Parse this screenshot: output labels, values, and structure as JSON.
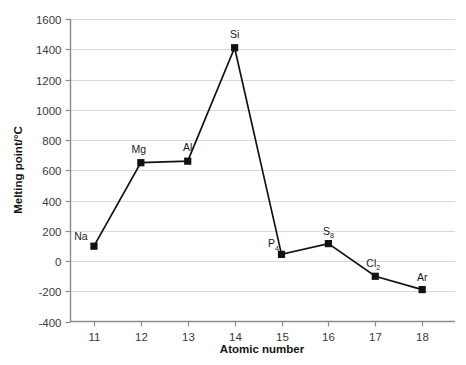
{
  "chart_data": {
    "type": "line",
    "title": "",
    "xlabel": "Atomic number",
    "ylabel": "Melting point/°C",
    "xlim": [
      10.5,
      18.7
    ],
    "ylim": [
      -400,
      1600
    ],
    "grid": true,
    "legend": "none",
    "x": [
      11,
      12,
      13,
      14,
      15,
      16,
      17,
      18
    ],
    "values": [
      98,
      650,
      660,
      1410,
      44,
      115,
      -101,
      -189
    ],
    "point_labels": [
      "Na",
      "Mg",
      "Al",
      "Si",
      "P4",
      "S8",
      "Cl2",
      "Ar"
    ],
    "point_label_parts": [
      {
        "base": "Na",
        "sub": ""
      },
      {
        "base": "Mg",
        "sub": ""
      },
      {
        "base": "Al",
        "sub": ""
      },
      {
        "base": "Si",
        "sub": ""
      },
      {
        "base": "P",
        "sub": "4"
      },
      {
        "base": "S",
        "sub": "8"
      },
      {
        "base": "Cl",
        "sub": "2"
      },
      {
        "base": "Ar",
        "sub": ""
      }
    ],
    "xticks": [
      "11",
      "12",
      "13",
      "14",
      "15",
      "16",
      "17",
      "18"
    ],
    "yticks": [
      "1600",
      "1400",
      "1200",
      "1000",
      "800",
      "600",
      "400",
      "200",
      "0",
      "-200",
      "-400"
    ],
    "ytick_values": [
      1600,
      1400,
      1200,
      1000,
      800,
      600,
      400,
      200,
      0,
      -200,
      -400
    ],
    "colors": {
      "line": "#111111",
      "marker": "#111111",
      "grid": "#d9d9d9",
      "axis": "#8c8c8c",
      "background": "#ffffff",
      "text": "#1a1a1a"
    }
  },
  "axes": {
    "x_title": "Atomic number",
    "y_title": "Melting point/°C"
  },
  "artifact": {
    "top_text": ""
  }
}
